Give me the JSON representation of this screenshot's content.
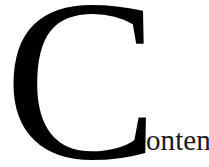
{
  "page": {
    "kind": "book-section-heading",
    "background_color": "#ffffff",
    "text_color": "#000000"
  },
  "heading": {
    "full_text": "Contents",
    "dropcap_letter": "C",
    "remainder_text": "ontents",
    "dropcap_color": "#000000",
    "remainder_color": "#1a1a1a"
  }
}
